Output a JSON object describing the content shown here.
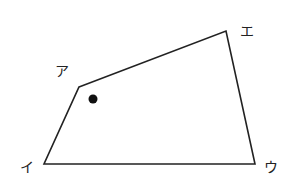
{
  "diagram": {
    "type": "quadrilateral",
    "stroke_color": "#222222",
    "background": "#ffffff",
    "vertices": [
      {
        "id": "a",
        "label": "ア",
        "x": 79,
        "y": 87,
        "label_x": 55,
        "label_y": 76
      },
      {
        "id": "e",
        "label": "エ",
        "x": 226,
        "y": 31,
        "label_x": 240,
        "label_y": 36
      },
      {
        "id": "u",
        "label": "ウ",
        "x": 255,
        "y": 164,
        "label_x": 264,
        "label_y": 172
      },
      {
        "id": "i",
        "label": "イ",
        "x": 44,
        "y": 164,
        "label_x": 20,
        "label_y": 172
      }
    ],
    "dot": {
      "x": 93,
      "y": 99,
      "r": 4.5
    }
  }
}
